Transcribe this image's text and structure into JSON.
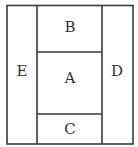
{
  "diagram": {
    "regions": [
      {
        "id": "A",
        "label": "A",
        "position": "center"
      },
      {
        "id": "B",
        "label": "B",
        "position": "top-center"
      },
      {
        "id": "C",
        "label": "C",
        "position": "bottom-center"
      },
      {
        "id": "D",
        "label": "D",
        "position": "right"
      },
      {
        "id": "E",
        "label": "E",
        "position": "left"
      }
    ],
    "colors": {
      "line": "#3a3a3a",
      "text": "#333333",
      "background": "#ffffff"
    }
  }
}
